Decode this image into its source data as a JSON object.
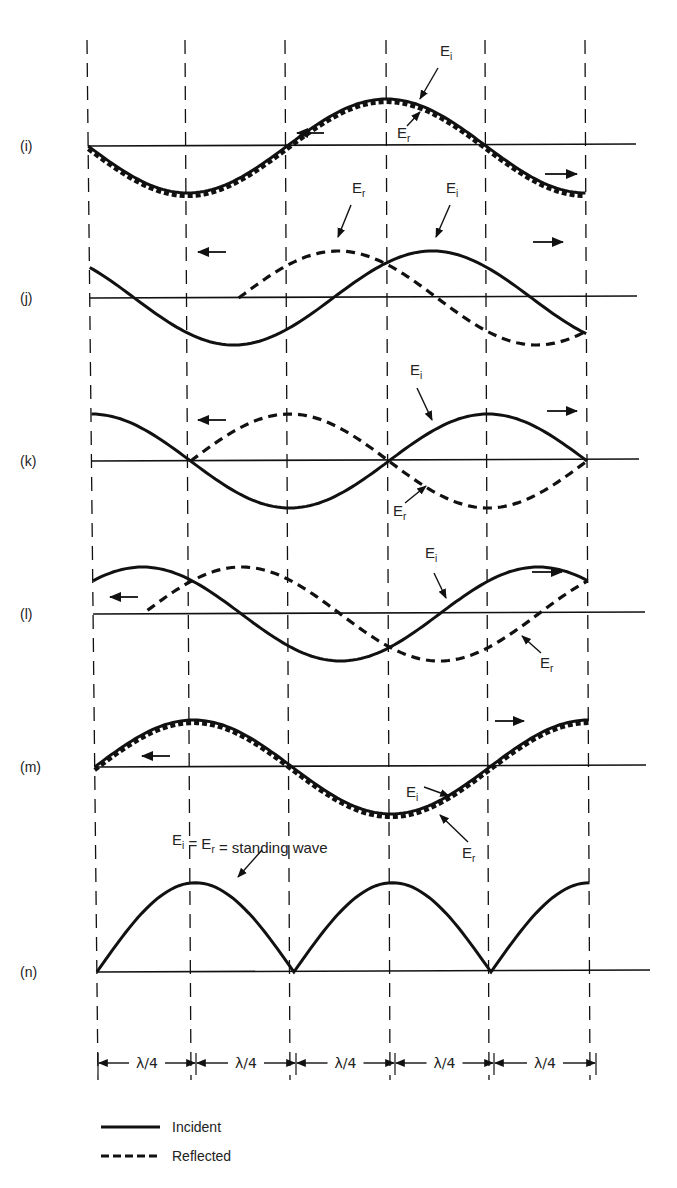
{
  "figure": {
    "colors": {
      "ink": "#111111",
      "background": "#ffffff"
    },
    "grid_x": [
      87,
      185,
      285,
      386,
      485,
      585
    ],
    "grid_x_bottom": [
      98,
      191,
      290,
      390,
      489,
      590
    ],
    "grid_top": 40,
    "grid_bottom": 1080,
    "amplitude": 47,
    "panels": [
      {
        "id": "i",
        "label": "(i)",
        "axis_y": 146,
        "axis_x_start": 87,
        "axis_x_end": 636,
        "incident": {
          "phase_deg": 180,
          "arrow_dir": "right"
        },
        "reflected": {
          "phase_deg": 180,
          "arrow_dir": "left",
          "overlaps_incident": true
        },
        "annotations": [
          {
            "text": "E",
            "sub": "i",
            "x": 440,
            "y": 56
          },
          {
            "text": "E",
            "sub": "r",
            "x": 397,
            "y": 138
          }
        ]
      },
      {
        "id": "j",
        "label": "(j)",
        "axis_y": 298,
        "axis_x_start": 88,
        "axis_x_end": 637,
        "annotations": [
          {
            "text": "E",
            "sub": "r",
            "x": 352,
            "y": 193
          },
          {
            "text": "E",
            "sub": "i",
            "x": 446,
            "y": 193
          }
        ]
      },
      {
        "id": "k",
        "label": "(k)",
        "axis_y": 461,
        "axis_x_start": 89,
        "axis_x_end": 639,
        "annotations": [
          {
            "text": "E",
            "sub": "i",
            "x": 410,
            "y": 375
          },
          {
            "text": "E",
            "sub": "r",
            "x": 393,
            "y": 516
          }
        ]
      },
      {
        "id": "l",
        "label": "(l)",
        "axis_y": 614,
        "axis_x_start": 92,
        "axis_x_end": 645,
        "annotations": [
          {
            "text": "E",
            "sub": "i",
            "x": 425,
            "y": 558
          },
          {
            "text": "E",
            "sub": "r",
            "x": 540,
            "y": 668
          }
        ]
      },
      {
        "id": "m",
        "label": "(m)",
        "axis_y": 767,
        "axis_x_start": 94,
        "axis_x_end": 646,
        "annotations": [
          {
            "text": "E",
            "sub": "i",
            "x": 406,
            "y": 797
          },
          {
            "text": "E",
            "sub": "r",
            "x": 462,
            "y": 858
          }
        ]
      },
      {
        "id": "n",
        "label": "(n)",
        "axis_y": 972,
        "axis_x_start": 96,
        "axis_x_end": 650,
        "annotations": [
          {
            "text": "E",
            "sub": "i",
            "x": 172,
            "y": 845,
            "caption": "E_i = E_r = standing wave"
          }
        ]
      }
    ],
    "standing_wave_caption": {
      "e1": "E",
      "s1": "i",
      "eq1": " = ",
      "e2": "E",
      "s2": "r",
      "rest": " = standing wave"
    },
    "dimension_label": "λ/4",
    "dimension_labels": [
      "λ/4",
      "λ/4",
      "λ/4",
      "λ/4",
      "λ/4"
    ],
    "legend": {
      "incident_label": "Incident",
      "reflected_label": "Reflected"
    }
  },
  "chart_data": {
    "type": "line",
    "xlabel": "distance (in quarter wavelengths)",
    "ylabel": "E",
    "x": [
      0,
      1,
      2,
      3,
      4,
      5
    ],
    "x_tick_labels": [
      "λ/4",
      "λ/4",
      "λ/4",
      "λ/4",
      "λ/4"
    ],
    "panels": [
      "(i)",
      "(j)",
      "(k)",
      "(l)",
      "(m)",
      "(n)"
    ],
    "legend": [
      "Incident",
      "Reflected"
    ],
    "series": [
      {
        "name": "(i) Incident",
        "values": [
          0,
          -1,
          0,
          1,
          0,
          -1
        ]
      },
      {
        "name": "(i) Reflected",
        "values": [
          0,
          -1,
          0,
          1,
          0,
          -1
        ]
      },
      {
        "name": "(j) Incident",
        "values": [
          0.7,
          -0.7,
          -0.7,
          0.7,
          0.7,
          -0.7
        ]
      },
      {
        "name": "(j) Reflected",
        "values": [
          null,
          0.7,
          0.7,
          0.7,
          -0.7,
          -0.7
        ]
      },
      {
        "name": "(k) Incident",
        "values": [
          1,
          0,
          -1,
          0,
          1,
          0
        ]
      },
      {
        "name": "(k) Reflected",
        "values": [
          null,
          0,
          1,
          0,
          -1,
          0
        ]
      },
      {
        "name": "(l) Incident",
        "values": [
          0.7,
          0.7,
          -0.7,
          -0.7,
          0.7,
          0.7
        ]
      },
      {
        "name": "(l) Reflected",
        "values": [
          null,
          0.7,
          0.7,
          -0.7,
          -0.7,
          0.7
        ]
      },
      {
        "name": "(m) Incident",
        "values": [
          0,
          1,
          0,
          -1,
          0,
          1
        ]
      },
      {
        "name": "(m) Reflected",
        "values": [
          0,
          1,
          0,
          -1,
          0,
          1
        ]
      },
      {
        "name": "(n) Standing wave |E|",
        "values": [
          0,
          1,
          0,
          1,
          0,
          1
        ]
      }
    ],
    "annotations": [
      "E_i",
      "E_r",
      "E_i = E_r = standing wave"
    ],
    "grid": "vertical dashed lines every λ/4"
  }
}
